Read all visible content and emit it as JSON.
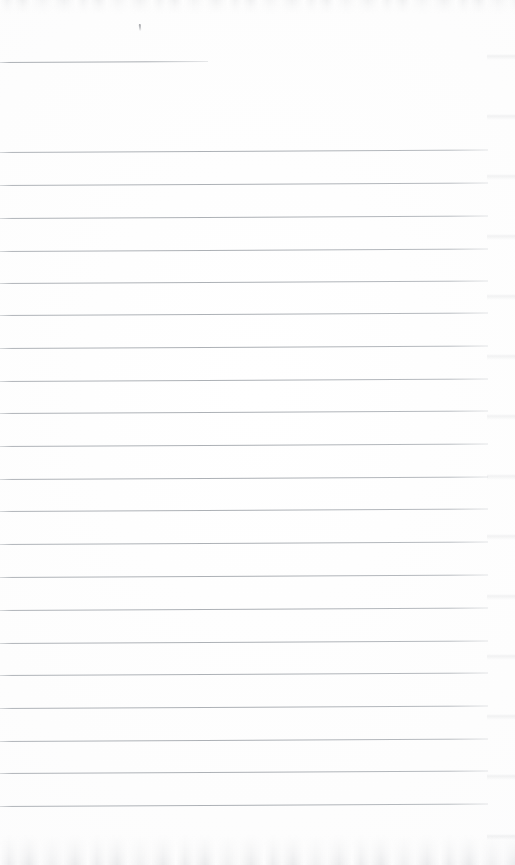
{
  "document": {
    "kind": "scanned-ruled-notebook-page",
    "title": "Blank ruled notepad page",
    "body_text": "",
    "page_width": 515,
    "page_height": 865
  },
  "colors": {
    "page_background": "#fdfdfd",
    "rule_line": "#babec2",
    "scan_edge_noise": "#b2b5ba",
    "pencil_mark": "#787a80"
  },
  "marks": [
    {
      "name": "pencil-tick",
      "type": "pencil-tick",
      "x": 139,
      "y": 24,
      "width": 2,
      "height": 7
    }
  ],
  "rules": [
    {
      "index": 1,
      "y": 62,
      "x_start": 0,
      "x_end": 208,
      "kind": "short",
      "tilt_deg": -0.3
    },
    {
      "index": 2,
      "y": 152,
      "x_start": 0,
      "x_end": 488,
      "kind": "full",
      "tilt_deg": -0.3
    },
    {
      "index": 3,
      "y": 185,
      "x_start": 0,
      "x_end": 488,
      "kind": "full",
      "tilt_deg": -0.3
    },
    {
      "index": 4,
      "y": 218,
      "x_start": 0,
      "x_end": 488,
      "kind": "full",
      "tilt_deg": -0.3
    },
    {
      "index": 5,
      "y": 251,
      "x_start": 0,
      "x_end": 488,
      "kind": "full",
      "tilt_deg": -0.3
    },
    {
      "index": 6,
      "y": 283,
      "x_start": 0,
      "x_end": 488,
      "kind": "full",
      "tilt_deg": -0.3
    },
    {
      "index": 7,
      "y": 315,
      "x_start": 0,
      "x_end": 488,
      "kind": "full",
      "tilt_deg": -0.3
    },
    {
      "index": 8,
      "y": 348,
      "x_start": 0,
      "x_end": 488,
      "kind": "full",
      "tilt_deg": -0.3
    },
    {
      "index": 9,
      "y": 381,
      "x_start": 0,
      "x_end": 488,
      "kind": "full",
      "tilt_deg": -0.3
    },
    {
      "index": 10,
      "y": 413,
      "x_start": 0,
      "x_end": 488,
      "kind": "full",
      "tilt_deg": -0.3
    },
    {
      "index": 11,
      "y": 446,
      "x_start": 0,
      "x_end": 488,
      "kind": "full",
      "tilt_deg": -0.3
    },
    {
      "index": 12,
      "y": 479,
      "x_start": 0,
      "x_end": 488,
      "kind": "full",
      "tilt_deg": -0.3
    },
    {
      "index": 13,
      "y": 511,
      "x_start": 0,
      "x_end": 488,
      "kind": "full",
      "tilt_deg": -0.3
    },
    {
      "index": 14,
      "y": 544,
      "x_start": 0,
      "x_end": 488,
      "kind": "full",
      "tilt_deg": -0.3
    },
    {
      "index": 15,
      "y": 577,
      "x_start": 0,
      "x_end": 488,
      "kind": "full",
      "tilt_deg": -0.3
    },
    {
      "index": 16,
      "y": 610,
      "x_start": 0,
      "x_end": 488,
      "kind": "full",
      "tilt_deg": -0.3
    },
    {
      "index": 17,
      "y": 643,
      "x_start": 0,
      "x_end": 488,
      "kind": "full",
      "tilt_deg": -0.3
    },
    {
      "index": 18,
      "y": 675,
      "x_start": 0,
      "x_end": 488,
      "kind": "full",
      "tilt_deg": -0.3
    },
    {
      "index": 19,
      "y": 708,
      "x_start": 0,
      "x_end": 488,
      "kind": "full",
      "tilt_deg": -0.3
    },
    {
      "index": 20,
      "y": 741,
      "x_start": 0,
      "x_end": 488,
      "kind": "full",
      "tilt_deg": -0.3
    },
    {
      "index": 21,
      "y": 773,
      "x_start": 0,
      "x_end": 488,
      "kind": "full",
      "tilt_deg": -0.3
    },
    {
      "index": 22,
      "y": 806,
      "x_start": 0,
      "x_end": 488,
      "kind": "full",
      "tilt_deg": -0.3
    }
  ]
}
